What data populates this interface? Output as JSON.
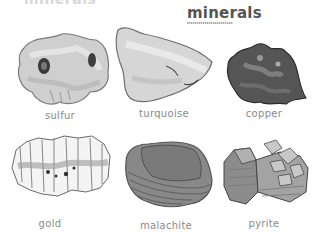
{
  "page": {
    "cut_title": "minerals",
    "title": "minerals"
  },
  "minerals": [
    {
      "name": "sulfur"
    },
    {
      "name": "turquoise"
    },
    {
      "name": "copper"
    },
    {
      "name": "gold"
    },
    {
      "name": "malachite"
    },
    {
      "name": "pyrite"
    }
  ]
}
